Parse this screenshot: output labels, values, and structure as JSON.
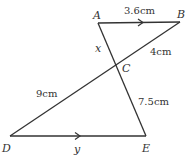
{
  "diagram": {
    "type": "geometry-similar-triangles",
    "points": {
      "A": {
        "label": "A",
        "x": 98,
        "y": 23
      },
      "B": {
        "label": "B",
        "x": 180,
        "y": 22
      },
      "C": {
        "label": "C",
        "x": 116,
        "y": 65
      },
      "D": {
        "label": "D",
        "x": 10,
        "y": 136
      },
      "E": {
        "label": "E",
        "x": 146,
        "y": 136
      }
    },
    "segments": [
      {
        "from": "A",
        "to": "B",
        "label": "3.6cm",
        "parallel_arrow": true
      },
      {
        "from": "B",
        "to": "C",
        "label": "4cm"
      },
      {
        "from": "A",
        "to": "C",
        "label": "x"
      },
      {
        "from": "C",
        "to": "D",
        "label": "9cm"
      },
      {
        "from": "C",
        "to": "E",
        "label": "7.5cm"
      },
      {
        "from": "D",
        "to": "E",
        "label": "y",
        "parallel_arrow": true
      }
    ],
    "labels": {
      "A": "A",
      "B": "B",
      "C": "C",
      "D": "D",
      "E": "E",
      "AB": "3.6cm",
      "BC": "4cm",
      "AC": "x",
      "CD": "9cm",
      "CE": "7.5cm",
      "DE": "y"
    },
    "colors": {
      "line": "#333333",
      "text": "#333333"
    }
  }
}
